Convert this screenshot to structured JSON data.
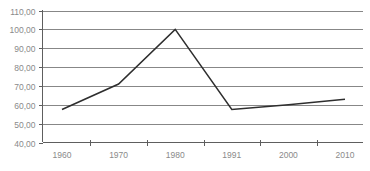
{
  "chart_data": {
    "type": "line",
    "title": "",
    "subtitle": "",
    "xlabel": "",
    "ylabel": "",
    "categories": [
      "1960",
      "1970",
      "1980",
      "1991",
      "2000",
      "2010"
    ],
    "x": [
      1960,
      1970,
      1980,
      1991,
      2000,
      2010
    ],
    "values": [
      57.5,
      71.0,
      100.0,
      57.5,
      60.0,
      63.0
    ],
    "series": [
      {
        "name": "",
        "values": [
          57.5,
          71.0,
          100.0,
          57.5,
          60.0,
          63.0
        ]
      }
    ],
    "ylim": [
      40,
      110
    ],
    "ytick_values": [
      110,
      100,
      90,
      80,
      70,
      60,
      50,
      40
    ],
    "ytick_labels": [
      "110,00",
      "100,00",
      "90,00",
      "80,00",
      "70,00",
      "60,00",
      "50,00",
      "40,00"
    ],
    "xtick_labels": [
      "1960",
      "1970",
      "1980",
      "1991",
      "2000",
      "2010"
    ],
    "grid": true,
    "grid_axis": "y",
    "legend": false,
    "legend_position": "none",
    "annotations": [],
    "colors": {
      "background": "#ffffff",
      "line": "#2e2e2e",
      "gridline": "#878787",
      "axis": "#5e5e5e",
      "tick_label": "#8a8a8a"
    }
  }
}
